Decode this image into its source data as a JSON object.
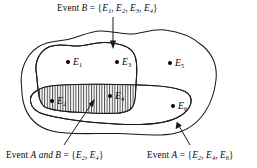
{
  "diagram": {
    "type": "venn-diagram",
    "title_labels": {
      "event_b": {
        "prefix": "Event ",
        "letter": "B",
        "equals": " = {",
        "elements": [
          "E1",
          "E2",
          "E3",
          "E4"
        ],
        "close": "}",
        "full_text": "Event B = {E1, E2, E3, E4}"
      },
      "event_a_and_b": {
        "prefix": "Event ",
        "letter": "A",
        "conjunction": " and ",
        "letter2": "B",
        "equals": " = {",
        "elements": [
          "E2",
          "E4"
        ],
        "close": "}",
        "full_text": "Event A and B = {E2, E4}"
      },
      "event_a": {
        "prefix": "Event ",
        "letter": "A",
        "equals": " = {",
        "elements": [
          "E2",
          "E4",
          "E6"
        ],
        "close": "}",
        "full_text": "Event A = {E2, E4, E6}"
      }
    },
    "sample_points": [
      {
        "name": "E1",
        "letter": "E",
        "index": "1",
        "x": 68,
        "y": 62,
        "in_a": false,
        "in_b": true
      },
      {
        "name": "E2",
        "letter": "E",
        "index": "2",
        "x": 52,
        "y": 101,
        "in_a": true,
        "in_b": true
      },
      {
        "name": "E3",
        "letter": "E",
        "index": "3",
        "x": 117,
        "y": 62,
        "in_a": false,
        "in_b": true
      },
      {
        "name": "E4",
        "letter": "E",
        "index": "4",
        "x": 110,
        "y": 96,
        "in_a": true,
        "in_b": true
      },
      {
        "name": "E5",
        "letter": "E",
        "index": "5",
        "x": 170,
        "y": 63,
        "in_a": false,
        "in_b": false
      },
      {
        "name": "E6",
        "letter": "E",
        "index": "6",
        "x": 173,
        "y": 106,
        "in_a": true,
        "in_b": false
      }
    ],
    "regions": {
      "sample_space": {
        "name": "sample-space-outline",
        "fill": "#ffffff",
        "stroke": "#1a1a1a"
      },
      "event_b": {
        "name": "event-b-region",
        "fill": "#ffffff",
        "stroke": "#1a1a1a"
      },
      "event_a": {
        "name": "event-a-region",
        "fill": "#ffffff",
        "stroke": "#1a1a1a"
      },
      "intersection": {
        "name": "a-and-b-intersection",
        "hatch": "vertical-lines",
        "stroke": "#1a1a1a"
      }
    },
    "colors": {
      "ink": "#1a1a1a",
      "background": "#ffffff",
      "point": "#000000"
    }
  }
}
